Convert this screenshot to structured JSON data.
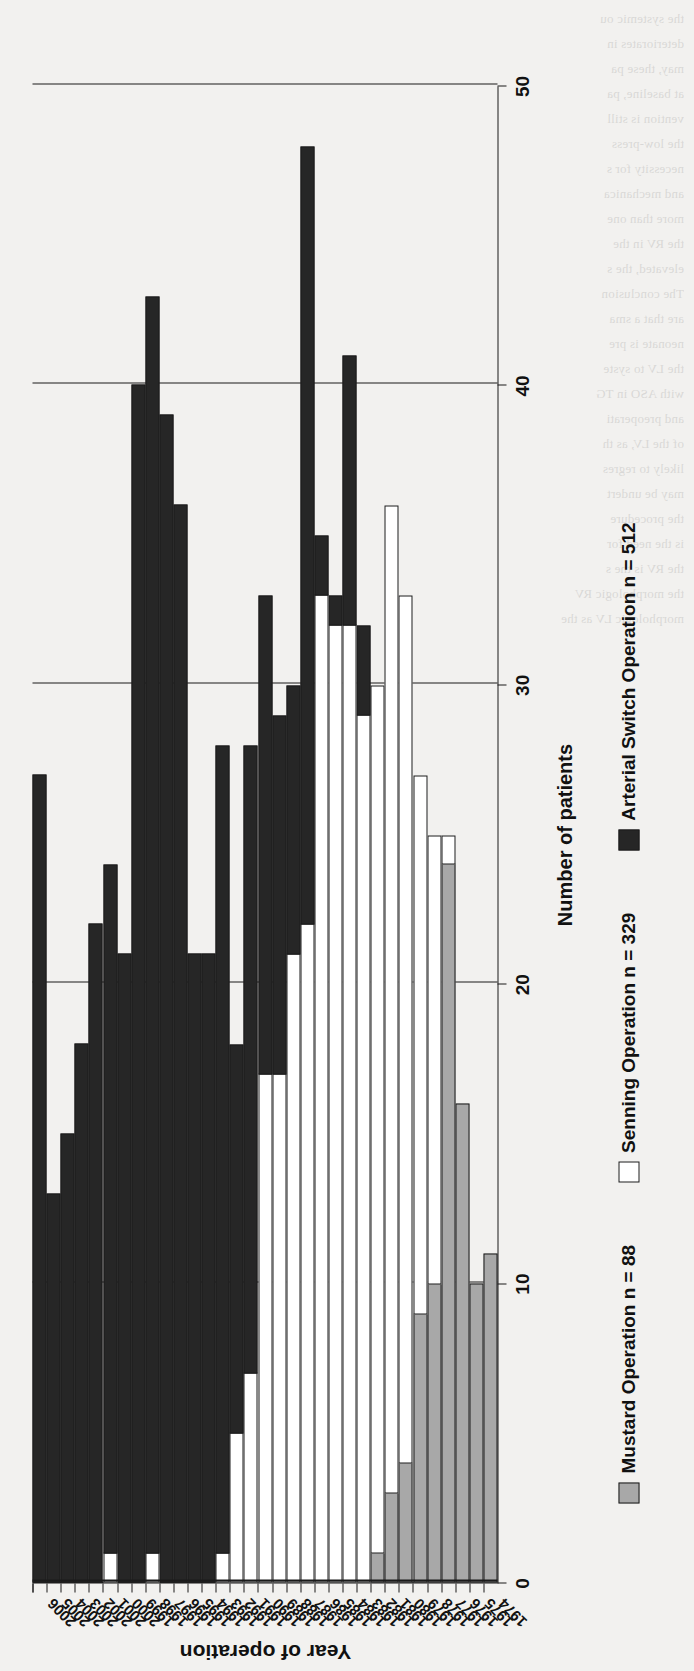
{
  "chart_data": {
    "type": "bar",
    "orientation": "vertical-rendered-rotated",
    "stacked": true,
    "title": "",
    "xlabel": "Year of operation",
    "ylabel": "Number of patients",
    "ylim": [
      0,
      50
    ],
    "yticks": [
      0,
      10,
      20,
      30,
      40,
      50
    ],
    "grid": true,
    "legend_position": "bottom",
    "categories": [
      "1974",
      "1975",
      "1976",
      "1977",
      "1978",
      "1979",
      "1980",
      "1981",
      "1982",
      "1983",
      "1984",
      "1985",
      "1986",
      "1987",
      "1988",
      "1989",
      "1990",
      "1991",
      "1992",
      "1993",
      "1994",
      "1995",
      "1996",
      "1997",
      "1998",
      "1999",
      "2000",
      "2001",
      "2002",
      "2003",
      "2004",
      "2005",
      "2006"
    ],
    "series": [
      {
        "name": "Mustard Operation n = 88",
        "color": "#a8a8a8",
        "values": [
          11,
          10,
          16,
          24,
          10,
          9,
          4,
          3,
          1,
          0,
          0,
          0,
          0,
          0,
          0,
          0,
          0,
          0,
          0,
          0,
          0,
          0,
          0,
          0,
          0,
          0,
          0,
          0,
          0,
          0,
          0,
          0,
          0
        ]
      },
      {
        "name": "Senning Operation n = 329",
        "color": "#ffffff",
        "values": [
          0,
          0,
          0,
          1,
          15,
          18,
          29,
          33,
          29,
          29,
          32,
          32,
          33,
          22,
          21,
          17,
          17,
          7,
          5,
          1,
          0,
          0,
          0,
          0,
          1,
          0,
          0,
          1,
          0,
          0,
          0,
          0,
          0
        ]
      },
      {
        "name": "Arterial Switch Operation n = 512",
        "color": "#262626",
        "values": [
          0,
          0,
          0,
          0,
          0,
          0,
          0,
          0,
          0,
          3,
          9,
          1,
          2,
          26,
          9,
          12,
          16,
          21,
          13,
          27,
          21,
          21,
          36,
          39,
          42,
          40,
          21,
          23,
          22,
          18,
          15,
          13,
          27
        ]
      }
    ],
    "totals": [
      11,
      10,
      16,
      25,
      25,
      27,
      33,
      36,
      30,
      32,
      41,
      33,
      35,
      48,
      30,
      29,
      33,
      28,
      18,
      28,
      21,
      21,
      36,
      39,
      43,
      40,
      21,
      24,
      22,
      18,
      15,
      13,
      27
    ]
  },
  "axis": {
    "y_title": "Number of patients",
    "x_title": "Year of operation",
    "y_ticks": [
      "0",
      "10",
      "20",
      "30",
      "40",
      "50"
    ]
  },
  "legend": {
    "items": [
      {
        "label": "Mustard Operation n = 88",
        "swatch": "mustard"
      },
      {
        "label": "Senning Operation n = 329",
        "swatch": "senning"
      },
      {
        "label": "Arterial Switch Operation n = 512",
        "swatch": "aso"
      }
    ]
  },
  "background_text": "the systemic ou\ndeteriorates in\nmay, these pa\nat baseline, pa\nvention is still\nthe low-press\nnecessity for s\nand mechanica\nmore than one\nthe RV in the\nelevated, the s\nThe conclusion\nare that a sma\nneonate is pre\nthe LV to syste\nwith ASO in TG\nand preoperati\nof the LV, as th\nlikely to regres\nmay be undert\nthe procedure\nis the need for\nthe RV is the s\nthe morphologic RV\nmorphologic LV as the\n"
}
